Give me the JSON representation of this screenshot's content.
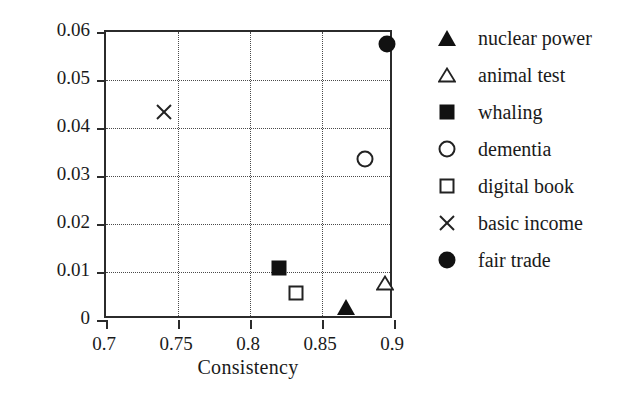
{
  "chart_data": {
    "type": "scatter",
    "title": "",
    "xlabel": "Consistency",
    "ylabel": "Activeness",
    "xlim": [
      0.7,
      0.9
    ],
    "ylim": [
      0,
      0.06
    ],
    "xticks": [
      "0.7",
      "0.75",
      "0.8",
      "0.85",
      "0.9"
    ],
    "xtick_values": [
      0.7,
      0.75,
      0.8,
      0.85,
      0.9
    ],
    "yticks": [
      "0",
      "0.01",
      "0.02",
      "0.03",
      "0.04",
      "0.05",
      "0.06"
    ],
    "ytick_values": [
      0,
      0.01,
      0.02,
      0.03,
      0.04,
      0.05,
      0.06
    ],
    "grid": true,
    "grid_style": "dotted",
    "legend_position": "right",
    "marker_color": "#111111",
    "axis_color": "#2b2b2b",
    "series": [
      {
        "name": "nuclear power",
        "marker": "triangle-filled",
        "x": 0.867,
        "y": 0.0027
      },
      {
        "name": "animal test",
        "marker": "triangle-open",
        "x": 0.894,
        "y": 0.0078
      },
      {
        "name": "whaling",
        "marker": "square-filled",
        "x": 0.82,
        "y": 0.0108
      },
      {
        "name": "dementia",
        "marker": "circle-open",
        "x": 0.88,
        "y": 0.0335
      },
      {
        "name": "digital book",
        "marker": "square-open",
        "x": 0.832,
        "y": 0.0056
      },
      {
        "name": "basic income",
        "marker": "cross",
        "x": 0.74,
        "y": 0.0433
      },
      {
        "name": "fair trade",
        "marker": "circle-filled",
        "x": 0.895,
        "y": 0.0575
      }
    ]
  }
}
